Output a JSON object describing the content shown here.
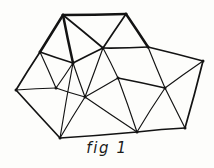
{
  "figure": {
    "caption": "fig 1",
    "kind": "hand-drawn triangulated polygon mesh",
    "colors": {
      "background": "#fdfdfb",
      "stroke": "#131313",
      "caption": "#1a1a1a"
    },
    "canvas": {
      "width": 214,
      "height": 168
    },
    "vertices": [
      {
        "id": "v0",
        "name": "top-left-apex",
        "x": 63,
        "y": 15
      },
      {
        "id": "v1",
        "name": "top-right-apex",
        "x": 126,
        "y": 14
      },
      {
        "id": "v2",
        "name": "upper-right-node",
        "x": 148,
        "y": 47
      },
      {
        "id": "v3",
        "name": "right-corner",
        "x": 203,
        "y": 61
      },
      {
        "id": "v4",
        "name": "right-mid-node",
        "x": 165,
        "y": 88
      },
      {
        "id": "v5",
        "name": "bottom-right-corner",
        "x": 185,
        "y": 128
      },
      {
        "id": "v6",
        "name": "bottom-mid-node",
        "x": 137,
        "y": 132
      },
      {
        "id": "v7",
        "name": "bottom-left-corner",
        "x": 60,
        "y": 138
      },
      {
        "id": "v8",
        "name": "left-corner",
        "x": 16,
        "y": 90
      },
      {
        "id": "v9",
        "name": "upper-left-node",
        "x": 40,
        "y": 52
      },
      {
        "id": "v10",
        "name": "inner-left-node",
        "x": 56,
        "y": 88
      },
      {
        "id": "v11",
        "name": "inner-upper-node",
        "x": 73,
        "y": 63
      },
      {
        "id": "v12",
        "name": "central-hub-upper",
        "x": 103,
        "y": 48
      },
      {
        "id": "v13",
        "name": "central-hub-lower",
        "x": 85,
        "y": 97
      },
      {
        "id": "v14",
        "name": "central-right-node",
        "x": 118,
        "y": 78
      }
    ],
    "edges": [
      {
        "from": "v0",
        "to": "v1",
        "weight": "thick"
      },
      {
        "from": "v1",
        "to": "v2",
        "weight": "thick"
      },
      {
        "from": "v2",
        "to": "v3",
        "weight": "med"
      },
      {
        "from": "v3",
        "to": "v5",
        "weight": "med"
      },
      {
        "from": "v5",
        "to": "v6",
        "weight": "med"
      },
      {
        "from": "v6",
        "to": "v7",
        "weight": "med"
      },
      {
        "from": "v7",
        "to": "v8",
        "weight": "med"
      },
      {
        "from": "v8",
        "to": "v9",
        "weight": "med"
      },
      {
        "from": "v9",
        "to": "v0",
        "weight": "thick"
      },
      {
        "from": "v0",
        "to": "v12",
        "weight": "med"
      },
      {
        "from": "v0",
        "to": "v11",
        "weight": "thick"
      },
      {
        "from": "v1",
        "to": "v12",
        "weight": "med"
      },
      {
        "from": "v2",
        "to": "v12",
        "weight": "med"
      },
      {
        "from": "v2",
        "to": "v4",
        "weight": "thin"
      },
      {
        "from": "v3",
        "to": "v4",
        "weight": "thin"
      },
      {
        "from": "v4",
        "to": "v5",
        "weight": "thin"
      },
      {
        "from": "v4",
        "to": "v6",
        "weight": "thin"
      },
      {
        "from": "v4",
        "to": "v14",
        "weight": "med"
      },
      {
        "from": "v12",
        "to": "v14",
        "weight": "thin"
      },
      {
        "from": "v12",
        "to": "v11",
        "weight": "med"
      },
      {
        "from": "v12",
        "to": "v13",
        "weight": "thin"
      },
      {
        "from": "v11",
        "to": "v9",
        "weight": "med"
      },
      {
        "from": "v11",
        "to": "v10",
        "weight": "thin"
      },
      {
        "from": "v11",
        "to": "v13",
        "weight": "thin"
      },
      {
        "from": "v9",
        "to": "v10",
        "weight": "thin"
      },
      {
        "from": "v10",
        "to": "v8",
        "weight": "thin"
      },
      {
        "from": "v10",
        "to": "v13",
        "weight": "thin"
      },
      {
        "from": "v13",
        "to": "v7",
        "weight": "thin"
      },
      {
        "from": "v13",
        "to": "v14",
        "weight": "thin"
      },
      {
        "from": "v13",
        "to": "v6",
        "weight": "thin"
      },
      {
        "from": "v14",
        "to": "v6",
        "weight": "thin"
      },
      {
        "from": "v7",
        "to": "v11",
        "weight": "thin"
      }
    ]
  }
}
